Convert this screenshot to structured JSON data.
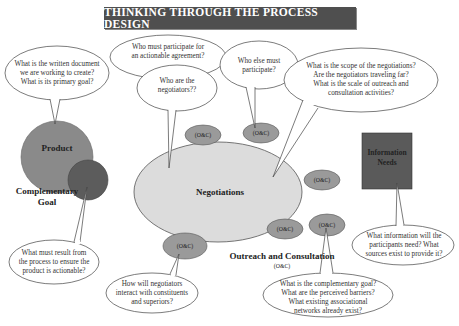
{
  "title": "THINKING THROUGH THE PROCESS DESIGN",
  "nodes": {
    "product": "Product",
    "complementary_goal": "Complementary\nGoal",
    "negotiations": "Negotiations",
    "information_needs": "Information\nNeeds",
    "outreach": "Outreach and Consultation",
    "outreach_abbr": "(O&C)"
  },
  "oc_label": "(O&C)",
  "bubbles": {
    "product_q": "What is the written document\nwe are working to create?\nWhat is its primary goal?",
    "participate_q": "Who must participate for\nan actionable agreement?",
    "negotiators_q": "Who are the\nnegotiators??",
    "else_q": "Who else must\nparticipate?",
    "scope_q": "What is the scope of the negotiations?\nAre the negotiators traveling far?\nWhat is the scale of outreach and\nconsultation activities?",
    "result_q": "What must result from\nthe process to ensure the\nproduct is actionable?",
    "interact_q": "How will negotiators\ninteract with constituents\nand superiors?",
    "complementary_q": "What is the complementary goal?\nWhat are the perceived barriers?\nWhat existing associational\nnetworks already exist?",
    "information_q": "What information will the\nparticipants need? What\nsources exist to provide it?"
  },
  "colors": {
    "title_bg": "#4f4f4f",
    "product": "#8a8a8a",
    "complementary": "#5c5c5c",
    "negotiations": "#dcdcdc",
    "oc": "#9a9a9a",
    "information": "#5a5a5a"
  }
}
